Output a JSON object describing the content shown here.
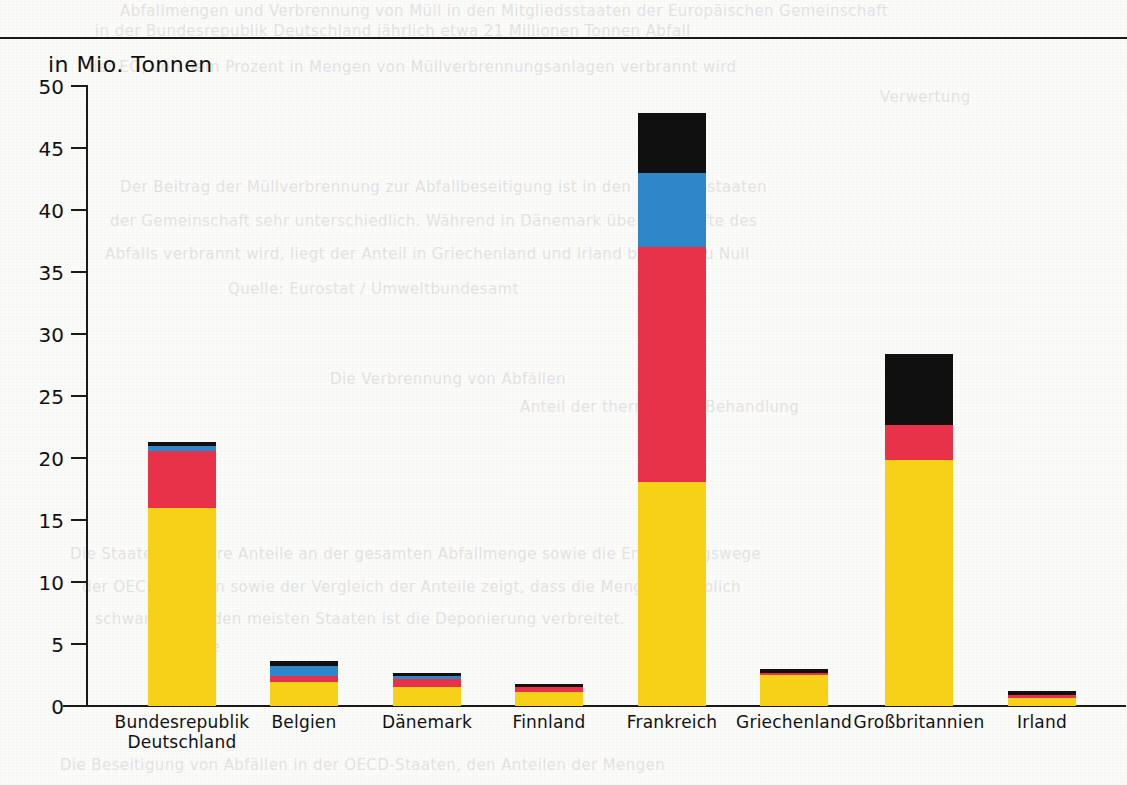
{
  "page": {
    "background_color": "#fbfbf9",
    "rule_color": "#1a1a1a"
  },
  "ghost_text": [
    {
      "text": "Abfallmengen und Verbrennung von Müll in den Mitgliedsstaaten der Europäischen Gemeinschaft",
      "x": 120,
      "y": 2
    },
    {
      "text": "in der Bundesrepublik Deutschland jährlich etwa 21 Millionen Tonnen Abfall",
      "x": 95,
      "y": 22
    },
    {
      "text": "der EG, von dem Prozent in Mengen von Müllverbrennungsanlagen verbrannt wird",
      "x": 88,
      "y": 58
    },
    {
      "text": "Verwertung",
      "x": 880,
      "y": 88
    },
    {
      "text": "Der Beitrag der Müllverbrennung zur Abfallbeseitigung ist in den Mitgliedsstaaten",
      "x": 120,
      "y": 178
    },
    {
      "text": "der Gemeinschaft sehr unterschiedlich. Während in Dänemark über die Hälfte des",
      "x": 110,
      "y": 212
    },
    {
      "text": "Abfalls verbrannt wird, liegt der Anteil in Griechenland und Irland bei nahezu Null",
      "x": 105,
      "y": 245
    },
    {
      "text": "Quelle: Eurostat / Umweltbundesamt",
      "x": 228,
      "y": 280
    },
    {
      "text": "Die Verbrennung von Abfällen",
      "x": 330,
      "y": 370
    },
    {
      "text": "Anteil der thermischen Behandlung",
      "x": 520,
      "y": 398
    },
    {
      "text": "Die Staaten und ihre Anteile an der gesamten Abfallmenge sowie die Entsorgungswege",
      "x": 70,
      "y": 545
    },
    {
      "text": "der OECD-Staaten sowie der Vergleich der Anteile zeigt, dass die Mengen erheblich",
      "x": 82,
      "y": 578
    },
    {
      "text": "schwanken. In den meisten Staaten ist die Deponierung verbreitet.",
      "x": 95,
      "y": 610
    },
    {
      "text": "Menge",
      "x": 168,
      "y": 638
    },
    {
      "text": "Die Beseitigung von Abfällen in der OECD-Staaten, den Anteilen der Mengen",
      "x": 60,
      "y": 756
    }
  ],
  "chart_data": {
    "type": "bar",
    "subtype": "stacked-bar",
    "title": "",
    "ylabel": "in Mio. Tonnen",
    "xlabel": "",
    "ylim": [
      0,
      50
    ],
    "ytick_step": 5,
    "yticks": [
      "50",
      "45",
      "40",
      "35",
      "30",
      "25",
      "20",
      "15",
      "10",
      "5",
      "0"
    ],
    "grid": false,
    "legend": "none",
    "categories": [
      "Bundesrepublik Deutschland",
      "Belgien",
      "Dänemark",
      "Finnland",
      "Frankreich",
      "Griechenland",
      "Großbritannien",
      "Irland"
    ],
    "category_lines": [
      [
        "Bundesrepublik",
        "Deutschland"
      ],
      [
        "Belgien"
      ],
      [
        "Dänemark"
      ],
      [
        "Finnland"
      ],
      [
        "Frankreich"
      ],
      [
        "Griechenland"
      ],
      [
        "Großbritannien"
      ],
      [
        "Irland"
      ]
    ],
    "series": [
      {
        "name": "yellow",
        "color": "#f7d117",
        "values": [
          16.0,
          1.9,
          1.5,
          1.15,
          18.1,
          2.5,
          19.8,
          0.65
        ]
      },
      {
        "name": "red",
        "color": "#e8324a",
        "values": [
          4.6,
          0.5,
          0.65,
          0.4,
          18.9,
          0.15,
          2.9,
          0.25
        ]
      },
      {
        "name": "blue",
        "color": "#2f86c8",
        "values": [
          0.35,
          0.8,
          0.25,
          0.0,
          6.0,
          0.0,
          0.0,
          0.0
        ]
      },
      {
        "name": "black",
        "color": "#101010",
        "values": [
          0.35,
          0.4,
          0.3,
          0.25,
          4.8,
          0.35,
          5.7,
          0.3
        ]
      }
    ],
    "totals": [
      21.3,
      3.6,
      2.7,
      1.8,
      47.8,
      3.0,
      28.4,
      1.2
    ]
  },
  "colors": {
    "yellow": "#f7d117",
    "red": "#e8324a",
    "blue": "#2f86c8",
    "black": "#101010",
    "axis": "#1a1a1a"
  },
  "layout": {
    "bar_lefts": [
      148,
      270,
      393,
      515,
      638,
      760,
      885,
      1008
    ],
    "bar_width": 68,
    "baseline_y": 706,
    "top_y": 86,
    "px_per_unit": 12.4
  }
}
